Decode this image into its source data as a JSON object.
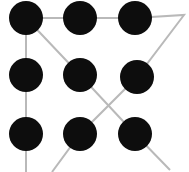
{
  "figure": {
    "background_color": "#ffffff",
    "width": 189,
    "height": 172
  },
  "style": {
    "dot_color": "#0d0d0d",
    "line_color": "#b9b9b9",
    "dot_radius": 16,
    "line_width": 2
  },
  "grid": {
    "rows": 3,
    "cols": 3,
    "col_x": [
      26,
      80,
      135
    ],
    "row_y": [
      18,
      75,
      134
    ],
    "dots": [
      {
        "id": "dot-top-left",
        "label": "1",
        "row": 0,
        "col": 0,
        "cx": 26,
        "cy": 18,
        "r": 17
      },
      {
        "id": "dot-top-center",
        "label": "2",
        "row": 0,
        "col": 1,
        "cx": 80,
        "cy": 18,
        "r": 17
      },
      {
        "id": "dot-top-right",
        "label": "3",
        "row": 0,
        "col": 2,
        "cx": 135,
        "cy": 18,
        "r": 17
      },
      {
        "id": "dot-middle-left",
        "label": "4",
        "row": 1,
        "col": 0,
        "cx": 26,
        "cy": 75,
        "r": 17
      },
      {
        "id": "dot-middle-center",
        "label": "5",
        "row": 1,
        "col": 1,
        "cx": 80,
        "cy": 75,
        "r": 17
      },
      {
        "id": "dot-middle-right",
        "label": "6",
        "row": 1,
        "col": 2,
        "cx": 137,
        "cy": 77,
        "r": 17
      },
      {
        "id": "dot-bottom-left",
        "label": "7",
        "row": 2,
        "col": 0,
        "cx": 26,
        "cy": 134,
        "r": 17
      },
      {
        "id": "dot-bottom-center",
        "label": "8",
        "row": 2,
        "col": 1,
        "cx": 80,
        "cy": 134,
        "r": 17
      },
      {
        "id": "dot-bottom-right",
        "label": "9",
        "row": 2,
        "col": 2,
        "cx": 135,
        "cy": 134,
        "r": 17
      }
    ]
  },
  "paths": [
    {
      "id": "path-left-column-and-top-row",
      "points": "26,172 26,134 26,75 26,18 80,18 135,18 184,15 137,77 80,134 52,172"
    },
    {
      "id": "path-main-diagonal",
      "points": "26,18 80,75 135,134 170,170"
    }
  ]
}
